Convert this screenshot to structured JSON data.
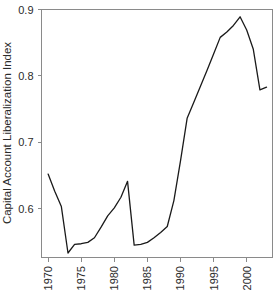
{
  "chart_data": {
    "type": "line",
    "title": "",
    "xlabel": "",
    "ylabel": "Capital Account Liberalization Index",
    "xlim": [
      1969.0,
      2003.9
    ],
    "ylim": [
      0.527,
      0.9
    ],
    "grid": false,
    "legend": null,
    "x_tick_labels": [
      "1970",
      "1975",
      "1980",
      "1985",
      "1990",
      "1995",
      "2000"
    ],
    "x_ticks": [
      1970,
      1975,
      1980,
      1985,
      1990,
      1995,
      2000
    ],
    "y_tick_labels": [
      "0.6",
      "0.7",
      "0.8",
      "0.9"
    ],
    "y_ticks": [
      0.6,
      0.7,
      0.8,
      0.9
    ],
    "series": [
      {
        "name": "Capital Account Liberalization Index",
        "color": "#1a1a1a",
        "x": [
          1970,
          1971,
          1972,
          1973,
          1974,
          1975,
          1976,
          1977,
          1978,
          1979,
          1980,
          1981,
          1982,
          1983,
          1984,
          1985,
          1986,
          1987,
          1988,
          1989,
          1990,
          1991,
          1992,
          1993,
          1994,
          1995,
          1996,
          1997,
          1998,
          1999,
          2000,
          2001,
          2002,
          2003
        ],
        "values": [
          0.652,
          0.626,
          0.603,
          0.533,
          0.546,
          0.547,
          0.549,
          0.556,
          0.572,
          0.589,
          0.601,
          0.617,
          0.641,
          0.545,
          0.546,
          0.549,
          0.556,
          0.564,
          0.573,
          0.612,
          0.672,
          0.736,
          0.76,
          0.784,
          0.808,
          0.833,
          0.858,
          0.866,
          0.876,
          0.889,
          0.869,
          0.84,
          0.779,
          0.783
        ]
      }
    ]
  },
  "axes": {
    "y_axis_label": "Capital Account Liberalization Index"
  }
}
